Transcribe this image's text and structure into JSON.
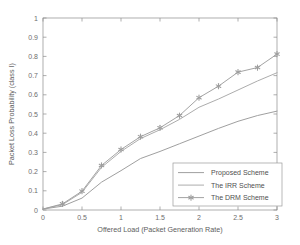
{
  "chart_data": {
    "type": "line",
    "title": "",
    "xlabel": "Offered Load (Packet Generation Rate)",
    "ylabel": "Packet Loss Probability (class I)",
    "xlim": [
      0,
      3
    ],
    "ylim": [
      0,
      1
    ],
    "xticks": [
      "0",
      "0.5",
      "1",
      "1.5",
      "2",
      "2.5",
      "3"
    ],
    "xtick_values": [
      0,
      0.5,
      1,
      1.5,
      2,
      2.5,
      3
    ],
    "yticks": [
      "0",
      "0.1",
      "0.2",
      "0.3",
      "0.4",
      "0.5",
      "0.6",
      "0.7",
      "0.8",
      "0.9",
      "1"
    ],
    "ytick_values": [
      0,
      0.1,
      0.2,
      0.3,
      0.4,
      0.5,
      0.6,
      0.7,
      0.8,
      0.9,
      1
    ],
    "grid": false,
    "legend_position": "lower right",
    "x": [
      0,
      0.25,
      0.5,
      0.75,
      1,
      1.25,
      1.5,
      1.75,
      2,
      2.25,
      2.5,
      2.75,
      3
    ],
    "series": [
      {
        "name": "Proposed Scheme",
        "color": "#9a9a9a",
        "marker": "none",
        "values": [
          0.005,
          0.02,
          0.062,
          0.145,
          0.205,
          0.268,
          0.305,
          0.345,
          0.385,
          0.425,
          0.462,
          0.492,
          0.515
        ]
      },
      {
        "name": "The IRR Scheme",
        "color": "#a8a8a8",
        "marker": "none",
        "values": [
          0.005,
          0.028,
          0.092,
          0.222,
          0.305,
          0.372,
          0.418,
          0.472,
          0.535,
          0.578,
          0.625,
          0.672,
          0.715
        ]
      },
      {
        "name": "The DRM Scheme",
        "color": "#9e9e9e",
        "marker": "asterisk",
        "values": [
          0.005,
          0.032,
          0.098,
          0.232,
          0.315,
          0.382,
          0.428,
          0.492,
          0.585,
          0.645,
          0.718,
          0.742,
          0.812
        ]
      }
    ]
  },
  "legend": {
    "entries": [
      {
        "label": "Proposed Scheme",
        "marker": "none"
      },
      {
        "label": "The IRR Scheme",
        "marker": "none"
      },
      {
        "label": "The DRM Scheme",
        "marker": "asterisk"
      }
    ]
  },
  "colors": {
    "axis": "#8c8c8c",
    "text": "#5d5d5d",
    "background": "#ffffff",
    "legend_border": "#9a9a9a"
  }
}
